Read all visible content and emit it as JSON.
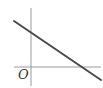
{
  "diagram": {
    "type": "coordinate-plot",
    "origin_label": "O",
    "axes": {
      "x_axis": {
        "x1": 14,
        "y1": 67,
        "x2": 101,
        "y2": 67,
        "color": "#9a9a9a"
      },
      "y_axis": {
        "x1": 31,
        "y1": 8,
        "x2": 31,
        "y2": 86,
        "color": "#9a9a9a"
      }
    },
    "line": {
      "description": "straight line with negative slope; positive y-intercept and positive x-intercept",
      "x1": 14,
      "y1": 21,
      "x2": 101,
      "y2": 80,
      "color": "#4a4a4a",
      "width": 2
    }
  }
}
